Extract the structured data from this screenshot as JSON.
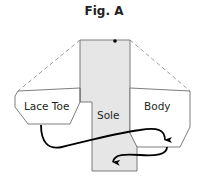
{
  "figure": {
    "title": "Fig. A",
    "labels": {
      "lace_toe": "Lace Toe",
      "sole": "Sole",
      "body": "Body"
    },
    "colors": {
      "sole_fill": "#e6e6e6",
      "outline": "#6d6e71",
      "dashed": "#808285",
      "arrow": "#000000",
      "text": "#231f20"
    }
  }
}
